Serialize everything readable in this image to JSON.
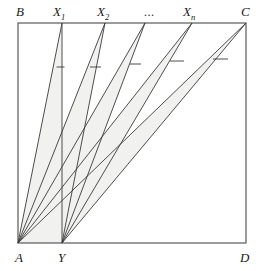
{
  "figure": {
    "background_color": "#ffffff",
    "stroke_color": "#3a3a3a",
    "fill_color": "#f1f1ef",
    "rect": {
      "left": 18,
      "top": 23,
      "right": 246,
      "bottom": 243
    },
    "labels": {
      "b": "B",
      "c": "C",
      "a": "A",
      "d": "D",
      "y": "Y",
      "x1_base": "X",
      "x1_sub": "1",
      "x2_base": "X",
      "x2_sub": "2",
      "xn_base": "X",
      "xn_sub": "n",
      "ellipsis": "..."
    },
    "label_positions": {
      "b": {
        "x": 16,
        "y": 16
      },
      "x1": {
        "x": 53,
        "y": 15
      },
      "x2": {
        "x": 97,
        "y": 15
      },
      "ellipsis": {
        "x": 144,
        "y": 16
      },
      "xn": {
        "x": 183,
        "y": 15
      },
      "c": {
        "x": 241,
        "y": 16
      },
      "a": {
        "x": 15,
        "y": 260
      },
      "y": {
        "x": 58,
        "y": 260
      },
      "d": {
        "x": 240,
        "y": 260
      }
    },
    "vertices": {
      "A": {
        "x": 18,
        "y": 243
      },
      "B": {
        "x": 18,
        "y": 23
      },
      "C": {
        "x": 246,
        "y": 23
      },
      "D": {
        "x": 246,
        "y": 243
      },
      "Y": {
        "x": 62,
        "y": 243
      }
    },
    "top_points": [
      {
        "name": "X1",
        "x": 62,
        "y": 23
      },
      {
        "name": "X2",
        "x": 105,
        "y": 23
      },
      {
        "name": "X3",
        "x": 145,
        "y": 23
      },
      {
        "name": "Xn",
        "x": 192,
        "y": 23
      },
      {
        "name": "C",
        "x": 246,
        "y": 23
      }
    ],
    "fan_from_A": [
      {
        "to": "X1",
        "x": 62,
        "y": 23
      },
      {
        "to": "X2",
        "x": 105,
        "y": 23
      },
      {
        "to": "X3",
        "x": 145,
        "y": 23
      },
      {
        "to": "Xn",
        "x": 192,
        "y": 23
      },
      {
        "to": "C",
        "x": 246,
        "y": 23
      }
    ],
    "fan_from_Y": [
      {
        "to": "X1",
        "x": 62,
        "y": 23
      },
      {
        "to": "X2",
        "x": 105,
        "y": 23
      },
      {
        "to": "X3",
        "x": 145,
        "y": 23
      },
      {
        "to": "Xn",
        "x": 192,
        "y": 23
      },
      {
        "to": "C",
        "x": 246,
        "y": 23
      }
    ],
    "tick_marks": [
      {
        "x1": 56.5,
        "y1": 67,
        "x2": 64.5,
        "y2": 67
      },
      {
        "x1": 90,
        "y1": 67,
        "x2": 101,
        "y2": 67
      },
      {
        "x1": 130,
        "y1": 64,
        "x2": 141,
        "y2": 64
      },
      {
        "x1": 170,
        "y1": 61,
        "x2": 184,
        "y2": 61
      },
      {
        "x1": 213,
        "y1": 59,
        "x2": 228,
        "y2": 59
      }
    ]
  }
}
